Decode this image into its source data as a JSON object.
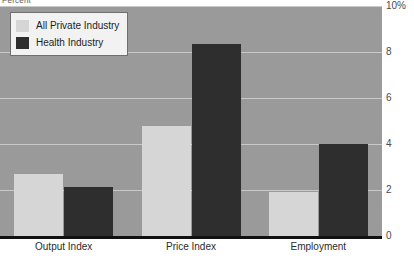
{
  "chart_data": {
    "type": "bar",
    "title": "",
    "subtitle": "",
    "axis_caption": "Percent",
    "xlabel": "",
    "ylabel": "",
    "ylim": [
      0,
      10
    ],
    "grid": true,
    "grid_axis": "y",
    "legend_position": "top-left",
    "categories": [
      "Output Index",
      "Price Index",
      "Employment"
    ],
    "yticks": [
      0,
      2,
      4,
      6,
      8,
      10
    ],
    "ytick_labels": [
      "0",
      "2",
      "4",
      "6",
      "8",
      "10%"
    ],
    "series": [
      {
        "name": "All Private Industry",
        "color": "#d6d6d6",
        "values": [
          2.7,
          4.8,
          1.9
        ]
      },
      {
        "name": "Health Industry",
        "color": "#2e2e2e",
        "values": [
          2.15,
          8.35,
          4.0
        ]
      }
    ],
    "plot_background": "#9a9a9a",
    "gridline_color": "#c9c9c9",
    "baseline_color": "#111111"
  },
  "legend": {
    "items": [
      {
        "label": "All Private Industry",
        "swatch": "light"
      },
      {
        "label": "Health Industry",
        "swatch": "dark"
      }
    ]
  }
}
